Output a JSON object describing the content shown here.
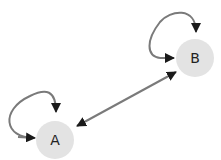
{
  "diagram": {
    "type": "directed-graph",
    "colors": {
      "node_fill": "#e3e3e3",
      "edge": "#7a7a7a",
      "arrowhead": "#1a1a1a",
      "label": "#222222"
    },
    "nodes": [
      {
        "id": "A",
        "label": "A"
      },
      {
        "id": "B",
        "label": "B"
      }
    ],
    "edges": [
      {
        "from": "A",
        "to": "A",
        "kind": "self-loop"
      },
      {
        "from": "B",
        "to": "B",
        "kind": "self-loop"
      },
      {
        "from": "A",
        "to": "B",
        "kind": "bidirectional"
      }
    ]
  }
}
